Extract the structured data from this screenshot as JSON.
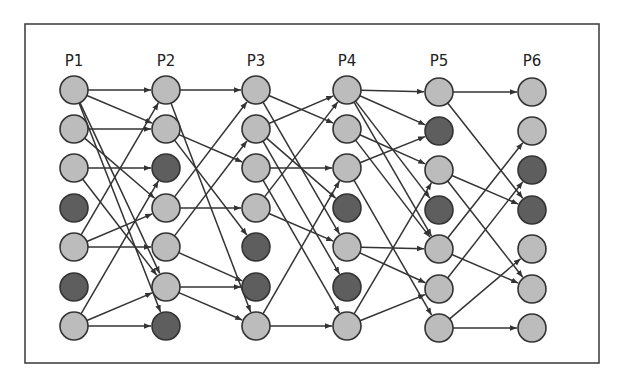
{
  "diagram": {
    "frame": {
      "x": 25,
      "y": 24,
      "w": 574,
      "h": 339
    },
    "colors": {
      "active": "#bcbcbc",
      "inactive": "#5e5e5e",
      "stroke": "#333333",
      "frame": "#444444"
    },
    "node_radius": 14,
    "columns": [
      {
        "label": "P1",
        "x": 74,
        "nodes": [
          "active",
          "active",
          "active",
          "inactive",
          "active",
          "inactive",
          "active"
        ]
      },
      {
        "label": "P2",
        "x": 166,
        "nodes": [
          "active",
          "active",
          "inactive",
          "active",
          "active",
          "active",
          "inactive"
        ]
      },
      {
        "label": "P3",
        "x": 256,
        "nodes": [
          "active",
          "active",
          "active",
          "active",
          "inactive",
          "inactive",
          "active"
        ]
      },
      {
        "label": "P4",
        "x": 347,
        "nodes": [
          "active",
          "active",
          "active",
          "inactive",
          "active",
          "inactive",
          "active"
        ]
      },
      {
        "label": "P5",
        "x": 439,
        "nodes": [
          "active",
          "inactive",
          "active",
          "inactive",
          "active",
          "active",
          "active"
        ]
      },
      {
        "label": "P6",
        "x": 532,
        "nodes": [
          "active",
          "active",
          "inactive",
          "inactive",
          "active",
          "active",
          "active"
        ]
      }
    ],
    "row_y": [
      90,
      129,
      168,
      208,
      247,
      287,
      326
    ],
    "edges": [
      [
        [
          0,
          0
        ],
        [
          1,
          0
        ]
      ],
      [
        [
          0,
          0
        ],
        [
          1,
          1
        ]
      ],
      [
        [
          0,
          0
        ],
        [
          1,
          5
        ]
      ],
      [
        [
          0,
          0
        ],
        [
          1,
          6
        ]
      ],
      [
        [
          0,
          1
        ],
        [
          1,
          1
        ]
      ],
      [
        [
          0,
          1
        ],
        [
          1,
          3
        ]
      ],
      [
        [
          0,
          2
        ],
        [
          1,
          2
        ]
      ],
      [
        [
          0,
          2
        ],
        [
          1,
          5
        ]
      ],
      [
        [
          0,
          4
        ],
        [
          1,
          0
        ]
      ],
      [
        [
          0,
          4
        ],
        [
          1,
          3
        ]
      ],
      [
        [
          0,
          4
        ],
        [
          1,
          4
        ]
      ],
      [
        [
          0,
          6
        ],
        [
          1,
          2
        ]
      ],
      [
        [
          0,
          6
        ],
        [
          1,
          5
        ]
      ],
      [
        [
          0,
          6
        ],
        [
          1,
          6
        ]
      ],
      [
        [
          1,
          0
        ],
        [
          2,
          0
        ]
      ],
      [
        [
          1,
          0
        ],
        [
          2,
          6
        ]
      ],
      [
        [
          1,
          1
        ],
        [
          2,
          2
        ]
      ],
      [
        [
          1,
          1
        ],
        [
          2,
          4
        ]
      ],
      [
        [
          1,
          3
        ],
        [
          2,
          0
        ]
      ],
      [
        [
          1,
          3
        ],
        [
          2,
          3
        ]
      ],
      [
        [
          1,
          4
        ],
        [
          2,
          1
        ]
      ],
      [
        [
          1,
          4
        ],
        [
          2,
          5
        ]
      ],
      [
        [
          1,
          5
        ],
        [
          2,
          5
        ]
      ],
      [
        [
          1,
          5
        ],
        [
          2,
          6
        ]
      ],
      [
        [
          2,
          0
        ],
        [
          3,
          1
        ]
      ],
      [
        [
          2,
          0
        ],
        [
          3,
          4
        ]
      ],
      [
        [
          2,
          1
        ],
        [
          3,
          0
        ]
      ],
      [
        [
          2,
          1
        ],
        [
          3,
          3
        ]
      ],
      [
        [
          2,
          1
        ],
        [
          3,
          5
        ]
      ],
      [
        [
          2,
          2
        ],
        [
          3,
          2
        ]
      ],
      [
        [
          2,
          2
        ],
        [
          3,
          6
        ]
      ],
      [
        [
          2,
          3
        ],
        [
          3,
          0
        ]
      ],
      [
        [
          2,
          3
        ],
        [
          3,
          4
        ]
      ],
      [
        [
          2,
          6
        ],
        [
          3,
          2
        ]
      ],
      [
        [
          2,
          6
        ],
        [
          3,
          6
        ]
      ],
      [
        [
          3,
          0
        ],
        [
          4,
          0
        ]
      ],
      [
        [
          3,
          0
        ],
        [
          4,
          1
        ]
      ],
      [
        [
          3,
          0
        ],
        [
          4,
          3
        ]
      ],
      [
        [
          3,
          0
        ],
        [
          4,
          4
        ]
      ],
      [
        [
          3,
          1
        ],
        [
          4,
          2
        ]
      ],
      [
        [
          3,
          1
        ],
        [
          4,
          4
        ]
      ],
      [
        [
          3,
          2
        ],
        [
          4,
          1
        ]
      ],
      [
        [
          3,
          2
        ],
        [
          4,
          6
        ]
      ],
      [
        [
          3,
          4
        ],
        [
          4,
          4
        ]
      ],
      [
        [
          3,
          4
        ],
        [
          4,
          5
        ]
      ],
      [
        [
          3,
          6
        ],
        [
          4,
          2
        ]
      ],
      [
        [
          3,
          6
        ],
        [
          4,
          5
        ]
      ],
      [
        [
          4,
          0
        ],
        [
          5,
          0
        ]
      ],
      [
        [
          4,
          0
        ],
        [
          5,
          3
        ]
      ],
      [
        [
          4,
          2
        ],
        [
          5,
          3
        ]
      ],
      [
        [
          4,
          2
        ],
        [
          5,
          5
        ]
      ],
      [
        [
          4,
          4
        ],
        [
          5,
          1
        ]
      ],
      [
        [
          4,
          4
        ],
        [
          5,
          5
        ]
      ],
      [
        [
          4,
          5
        ],
        [
          5,
          2
        ]
      ],
      [
        [
          4,
          6
        ],
        [
          5,
          4
        ]
      ],
      [
        [
          4,
          6
        ],
        [
          5,
          6
        ]
      ]
    ]
  }
}
